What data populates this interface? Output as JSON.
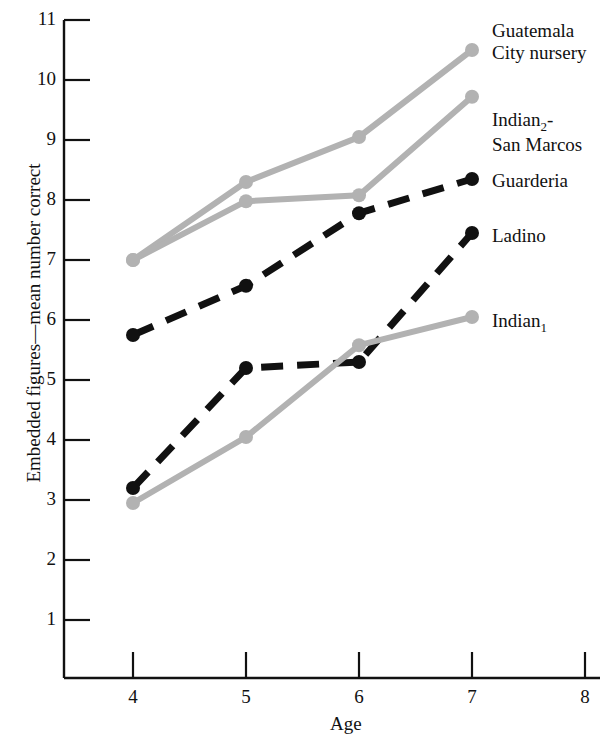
{
  "chart_data": {
    "type": "line",
    "title": "",
    "xlabel": "Age",
    "ylabel": "Embedded figures—mean number correct",
    "x": [
      4,
      5,
      6,
      7
    ],
    "xlim": [
      3.5,
      8
    ],
    "ylim": [
      0,
      11
    ],
    "xticks": [
      4,
      5,
      6,
      7,
      8
    ],
    "yticks": [
      1,
      2,
      3,
      4,
      5,
      6,
      7,
      8,
      9,
      10,
      11
    ],
    "grid": false,
    "legend_position": "right-inline-at-line-end",
    "series": [
      {
        "name": "Guatemala City nursery",
        "label_lines": [
          "Guatemala",
          "City nursery"
        ],
        "color": "#b2b2b2",
        "line_style": "solid",
        "marker": "circle",
        "values": [
          7.0,
          8.3,
          9.05,
          10.5
        ]
      },
      {
        "name": "Indian2-San Marcos",
        "label_lines": [
          "Indian₂-",
          "San Marcos"
        ],
        "label_base": "Indian",
        "label_sub": "2",
        "label_tail": "-",
        "color": "#b2b2b2",
        "line_style": "solid",
        "marker": "circle",
        "values": [
          7.0,
          7.98,
          8.08,
          9.72
        ]
      },
      {
        "name": "Guarderia",
        "label_lines": [
          "Guarderia"
        ],
        "color": "#111111",
        "line_style": "dashed",
        "marker": "circle",
        "values": [
          5.75,
          6.57,
          7.78,
          8.35
        ]
      },
      {
        "name": "Ladino",
        "label_lines": [
          "Ladino"
        ],
        "color": "#111111",
        "line_style": "dashed",
        "marker": "circle",
        "values": [
          3.2,
          5.2,
          5.3,
          7.45
        ]
      },
      {
        "name": "Indian1",
        "label_lines": [
          "Indian₁"
        ],
        "label_base": "Indian",
        "label_sub": "1",
        "label_tail": "",
        "color": "#b2b2b2",
        "line_style": "solid",
        "marker": "circle",
        "values": [
          2.95,
          4.05,
          5.58,
          6.05
        ]
      }
    ]
  },
  "axes": {
    "y_tick_labels": [
      "11",
      "10",
      "9",
      "8",
      "7",
      "6",
      "5",
      "4",
      "3",
      "2",
      "1"
    ],
    "x_tick_labels": [
      "4",
      "5",
      "6",
      "7",
      "8"
    ],
    "y_axis_title": "Embedded figures—mean number correct",
    "x_axis_title": "Age"
  },
  "legend": {
    "guatemala_line1": "Guatemala",
    "guatemala_line2": "City nursery",
    "indian2_line1_base": "Indian",
    "indian2_line1_sub": "2",
    "indian2_line1_tail": "-",
    "indian2_line2": "San Marcos",
    "guarderia": "Guarderia",
    "ladino": "Ladino",
    "indian1_base": "Indian",
    "indian1_sub": "1"
  },
  "colors": {
    "gray_series": "#b2b2b2",
    "black_series": "#111111",
    "axis": "#111111",
    "background": "#ffffff"
  }
}
